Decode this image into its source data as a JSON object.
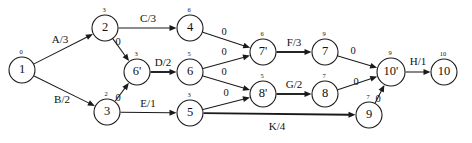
{
  "diagram": {
    "type": "directed-graph",
    "width": 472,
    "height": 143,
    "node_radius": 13,
    "colors": {
      "stroke": "#1a1a1a",
      "fill": "#ffffff",
      "text": "#111111",
      "background": "#ffffff"
    },
    "nodes": [
      {
        "id": "n1",
        "label": "1",
        "time": "0",
        "x": 22,
        "y": 70,
        "r": 13
      },
      {
        "id": "n2",
        "label": "2",
        "time": "3",
        "x": 105,
        "y": 28,
        "r": 13
      },
      {
        "id": "n3",
        "label": "3",
        "time": "2",
        "x": 107,
        "y": 112,
        "r": 13
      },
      {
        "id": "n6p",
        "label": "6'",
        "time": "3",
        "x": 137,
        "y": 72,
        "r": 13
      },
      {
        "id": "n4",
        "label": "4",
        "time": "6",
        "x": 190,
        "y": 28,
        "r": 13
      },
      {
        "id": "n6",
        "label": "6",
        "time": "5",
        "x": 190,
        "y": 72,
        "r": 13
      },
      {
        "id": "n5",
        "label": "5",
        "time": "3",
        "x": 190,
        "y": 113,
        "r": 13
      },
      {
        "id": "n7p",
        "label": "7'",
        "time": "6",
        "x": 263,
        "y": 52,
        "r": 13
      },
      {
        "id": "n8p",
        "label": "8'",
        "time": "5",
        "x": 263,
        "y": 94,
        "r": 13
      },
      {
        "id": "n7",
        "label": "7",
        "time": "9",
        "x": 325,
        "y": 52,
        "r": 13
      },
      {
        "id": "n8",
        "label": "8",
        "time": "7",
        "x": 325,
        "y": 94,
        "r": 13
      },
      {
        "id": "n9",
        "label": "9",
        "time": "7",
        "x": 369,
        "y": 115,
        "r": 13
      },
      {
        "id": "n10p",
        "label": "10'",
        "time": "9",
        "x": 391,
        "y": 72,
        "r": 14
      },
      {
        "id": "n10",
        "label": "10",
        "time": "10",
        "x": 444,
        "y": 72,
        "r": 13
      }
    ],
    "edges": [
      {
        "id": "e1",
        "from": "n1",
        "to": "n2",
        "label": "A/3",
        "label_x": 60,
        "label_y": 40,
        "thick": false
      },
      {
        "id": "e2",
        "from": "n1",
        "to": "n3",
        "label": "B/2",
        "label_x": 62,
        "label_y": 100,
        "thick": false
      },
      {
        "id": "e3",
        "from": "n2",
        "to": "n4",
        "label": "C/3",
        "label_x": 148,
        "label_y": 19,
        "thick": false
      },
      {
        "id": "e4",
        "from": "n2",
        "to": "n6p",
        "label": "0",
        "label_x": 118,
        "label_y": 43,
        "thick": false
      },
      {
        "id": "e5",
        "from": "n3",
        "to": "n6p",
        "label": "0",
        "label_x": 118,
        "label_y": 99,
        "thick": false
      },
      {
        "id": "e6",
        "from": "n6p",
        "to": "n6",
        "label": "D/2",
        "label_x": 163,
        "label_y": 63,
        "thick": true
      },
      {
        "id": "e7",
        "from": "n3",
        "to": "n5",
        "label": "E/1",
        "label_x": 148,
        "label_y": 104,
        "thick": false
      },
      {
        "id": "e8",
        "from": "n4",
        "to": "n7p",
        "label": "0",
        "label_x": 224,
        "label_y": 33,
        "thick": false
      },
      {
        "id": "e9",
        "from": "n6",
        "to": "n7p",
        "label": "0",
        "label_x": 224,
        "label_y": 53,
        "thick": false
      },
      {
        "id": "e10",
        "from": "n6",
        "to": "n8p",
        "label": "0",
        "label_x": 224,
        "label_y": 73,
        "thick": false
      },
      {
        "id": "e11",
        "from": "n5",
        "to": "n8p",
        "label": "0",
        "label_x": 226,
        "label_y": 94,
        "thick": false
      },
      {
        "id": "e12",
        "from": "n7p",
        "to": "n7",
        "label": "F/3",
        "label_x": 294,
        "label_y": 43,
        "thick": true
      },
      {
        "id": "e13",
        "from": "n8p",
        "to": "n8",
        "label": "G/2",
        "label_x": 294,
        "label_y": 85,
        "thick": true
      },
      {
        "id": "e14",
        "from": "n7",
        "to": "n10p",
        "label": "0",
        "label_x": 353,
        "label_y": 52,
        "thick": false
      },
      {
        "id": "e15",
        "from": "n8",
        "to": "n10p",
        "label": "0",
        "label_x": 356,
        "label_y": 83,
        "thick": false
      },
      {
        "id": "e16",
        "from": "n9",
        "to": "n10p",
        "label": "0",
        "label_x": 378,
        "label_y": 100,
        "thick": false
      },
      {
        "id": "e17",
        "from": "n5",
        "to": "n9",
        "label": "K/4",
        "label_x": 277,
        "label_y": 127,
        "thick": true
      },
      {
        "id": "e18",
        "from": "n10p",
        "to": "n10",
        "label": "H/1",
        "label_x": 418,
        "label_y": 62,
        "thick": false
      }
    ]
  }
}
